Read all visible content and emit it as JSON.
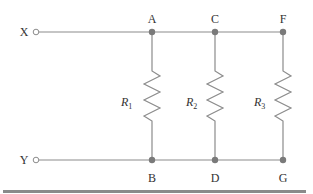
{
  "diagram": {
    "type": "circuit-parallel-resistors",
    "terminals": [
      {
        "id": "X",
        "label": "X",
        "x": 36,
        "y": 32
      },
      {
        "id": "Y",
        "label": "Y",
        "x": 36,
        "y": 160
      }
    ],
    "nodes_top": [
      {
        "label": "A",
        "x": 152,
        "y": 32
      },
      {
        "label": "C",
        "x": 215,
        "y": 32
      },
      {
        "label": "F",
        "x": 283,
        "y": 32
      }
    ],
    "nodes_bottom": [
      {
        "label": "B",
        "x": 152,
        "y": 160
      },
      {
        "label": "D",
        "x": 215,
        "y": 160
      },
      {
        "label": "G",
        "x": 283,
        "y": 160
      }
    ],
    "resistors": [
      {
        "name": "R",
        "sub": "1",
        "between": "A-B"
      },
      {
        "name": "R",
        "sub": "2",
        "between": "C-D"
      },
      {
        "name": "R",
        "sub": "3",
        "between": "F-G"
      }
    ],
    "colors": {
      "wire": "#8c8c8c",
      "node": "#7a7a7a",
      "text": "#333333",
      "bar": "#8a8a8a"
    }
  }
}
